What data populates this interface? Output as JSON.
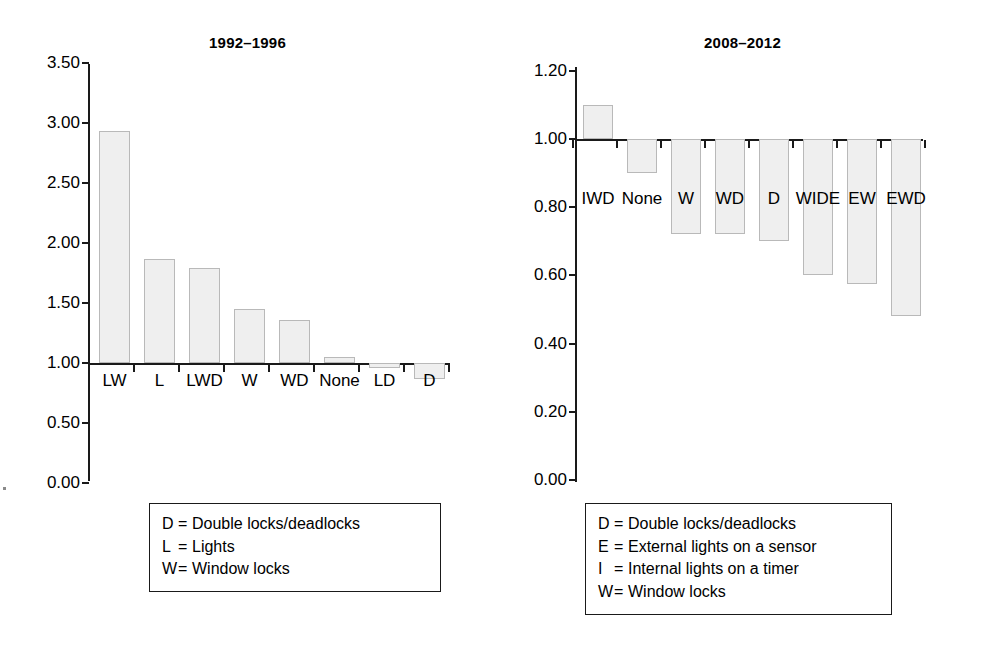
{
  "chart_data": [
    {
      "type": "bar",
      "title": "1992–1996",
      "xlabel": "",
      "ylabel": "",
      "categories": [
        "LW",
        "L",
        "LWD",
        "W",
        "WD",
        "None",
        "LD",
        "D"
      ],
      "values": [
        2.93,
        1.87,
        1.79,
        1.45,
        1.36,
        1.05,
        0.96,
        0.87
      ],
      "ytick_labels": [
        "3.50",
        "3.00",
        "2.50",
        "2.00",
        "1.50",
        "1.00",
        "0.50",
        "0.00"
      ],
      "ytick_values": [
        3.5,
        3.0,
        2.5,
        2.0,
        1.5,
        1.0,
        0.5,
        0.0
      ],
      "ylim": [
        0.0,
        3.5
      ],
      "baseline": 1.0,
      "grid": false,
      "legend_position": "below-plot"
    },
    {
      "type": "bar",
      "title": "2008–2012",
      "xlabel": "",
      "ylabel": "",
      "categories": [
        "IWD",
        "None",
        "W",
        "WD",
        "D",
        "WIDE",
        "EW",
        "EWD"
      ],
      "values": [
        1.1,
        0.9,
        0.72,
        0.72,
        0.7,
        0.6,
        0.575,
        0.48
      ],
      "ytick_labels": [
        "1.20",
        "1.00",
        "0.80",
        "0.60",
        "0.40",
        "0.20",
        "0.00"
      ],
      "ytick_values": [
        1.2,
        1.0,
        0.8,
        0.6,
        0.4,
        0.2,
        0.0
      ],
      "ylim": [
        0.0,
        1.2
      ],
      "baseline": 1.0,
      "grid": false,
      "legend_position": "below-plot"
    }
  ],
  "left_panel": {
    "title": "1992–1996",
    "y_ticks": [
      {
        "label": "3.50"
      },
      {
        "label": "3.00"
      },
      {
        "label": "2.50"
      },
      {
        "label": "2.00"
      },
      {
        "label": "1.50"
      },
      {
        "label": "1.00"
      },
      {
        "label": "0.50"
      },
      {
        "label": "0.00"
      }
    ],
    "categories": [
      {
        "label": "LW"
      },
      {
        "label": "L"
      },
      {
        "label": "LWD"
      },
      {
        "label": "W"
      },
      {
        "label": "WD"
      },
      {
        "label": "None"
      },
      {
        "label": "LD"
      },
      {
        "label": "D"
      }
    ],
    "legend": [
      {
        "key": "D",
        "eq": "=",
        "text": "Double locks/deadlocks"
      },
      {
        "key": "L",
        "eq": "=",
        "text": "Lights"
      },
      {
        "key": "W",
        "eq": "=",
        "text": "Window locks"
      }
    ]
  },
  "right_panel": {
    "title": "2008–2012",
    "y_ticks": [
      {
        "label": "1.20"
      },
      {
        "label": "1.00"
      },
      {
        "label": "0.80"
      },
      {
        "label": "0.60"
      },
      {
        "label": "0.40"
      },
      {
        "label": "0.20"
      },
      {
        "label": "0.00"
      }
    ],
    "categories": [
      {
        "label": "IWD"
      },
      {
        "label": "None"
      },
      {
        "label": "W"
      },
      {
        "label": "WD"
      },
      {
        "label": "D"
      },
      {
        "label": "WIDE"
      },
      {
        "label": "EW"
      },
      {
        "label": "EWD"
      }
    ],
    "legend": [
      {
        "key": "D",
        "eq": "=",
        "text": "Double locks/deadlocks"
      },
      {
        "key": "E",
        "eq": "=",
        "text": "External lights on a sensor"
      },
      {
        "key": "I",
        "eq": "=",
        "text": "Internal lights on a timer"
      },
      {
        "key": "W",
        "eq": "=",
        "text": "Window locks"
      }
    ]
  },
  "colors": {
    "bar_fill": "#efefef",
    "bar_stroke": "#b9b9b9",
    "axis": "#1a1a1a",
    "text": "#000000",
    "background": "#ffffff"
  }
}
